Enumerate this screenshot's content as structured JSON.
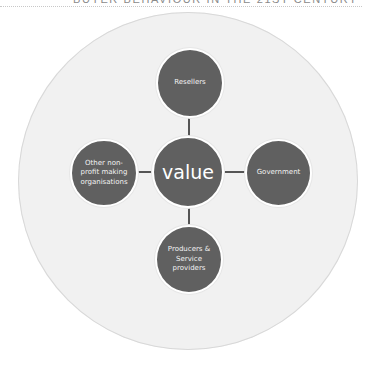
{
  "header": {
    "running_title": "BUYER BEHAVIOUR IN THE 21ST CENTURY"
  },
  "diagram": {
    "type": "hub-and-spoke",
    "center": {
      "label": "value"
    },
    "spokes": [
      {
        "position": "top",
        "label": "Resellers"
      },
      {
        "position": "right",
        "label": "Government"
      },
      {
        "position": "bottom",
        "label": "Producers & Service providers"
      },
      {
        "position": "left",
        "label": "Other non-profit making organisations"
      }
    ],
    "colors": {
      "node_fill": "#606060",
      "node_text": "#f2f2f2",
      "connector": "#555555",
      "outer_circle": "#f1f1f1"
    }
  }
}
